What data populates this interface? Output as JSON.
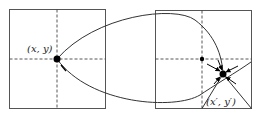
{
  "diagram": {
    "left_box": {
      "label": "(x, y)"
    },
    "right_box": {
      "label": "(x′, y′)"
    },
    "colors": {
      "stroke": "#333333",
      "dash": "#444444",
      "dot": "#000000",
      "background": "#ffffff"
    }
  }
}
